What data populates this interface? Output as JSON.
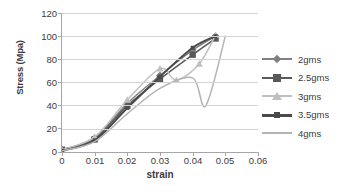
{
  "chart_data": {
    "type": "line",
    "title": "",
    "xlabel": "strain",
    "ylabel": "Stress (Mpa)",
    "xlim": [
      0,
      0.06
    ],
    "ylim": [
      0,
      120
    ],
    "xticks": [
      "0",
      "0.01",
      "0.02",
      "0.03",
      "0.04",
      "0.05",
      "0.06"
    ],
    "xtick_values": [
      0,
      0.01,
      0.02,
      0.03,
      0.04,
      0.05,
      0.06
    ],
    "yticks": [
      "0",
      "20",
      "40",
      "60",
      "80",
      "100",
      "120"
    ],
    "ytick_values": [
      0,
      20,
      40,
      60,
      80,
      100,
      120
    ],
    "grid": "horizontal",
    "legend_position": "right",
    "x": [
      0,
      0.01,
      0.02,
      0.03,
      0.04,
      0.047
    ],
    "series": [
      {
        "name": "2gms",
        "marker": "diamond",
        "color": "#808080",
        "x": [
          0,
          0.01,
          0.02,
          0.03,
          0.04,
          0.047
        ],
        "values": [
          2,
          12,
          42,
          66,
          88,
          100
        ]
      },
      {
        "name": "2.5gms",
        "marker": "square",
        "color": "#595959",
        "x": [
          0,
          0.01,
          0.02,
          0.03,
          0.04,
          0.047
        ],
        "values": [
          2,
          11,
          40,
          63,
          84,
          98
        ]
      },
      {
        "name": "3gms",
        "marker": "triangle",
        "color": "#bfbfbf",
        "x": [
          0,
          0.01,
          0.02,
          0.03,
          0.035,
          0.042,
          0.047
        ],
        "values": [
          2,
          13,
          45,
          72,
          62,
          76,
          101
        ]
      },
      {
        "name": "3.5gms",
        "marker": "line",
        "color": "#4a4a4a",
        "x": [
          0,
          0.01,
          0.02,
          0.03,
          0.04,
          0.047
        ],
        "values": [
          1,
          10,
          38,
          65,
          90,
          100
        ]
      },
      {
        "name": "4gms",
        "marker": "none",
        "color": "#b3b3b3",
        "x": [
          0,
          0.01,
          0.02,
          0.03,
          0.04,
          0.044,
          0.05
        ],
        "values": [
          1,
          9,
          33,
          55,
          64,
          40,
          100
        ]
      }
    ]
  }
}
